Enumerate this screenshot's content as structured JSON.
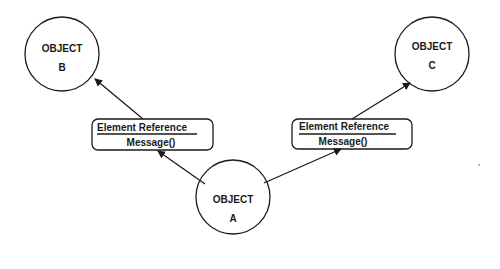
{
  "objects": {
    "a": {
      "title": "OBJECT",
      "letter": "A"
    },
    "b": {
      "title": "OBJECT",
      "letter": "B"
    },
    "c": {
      "title": "OBJECT",
      "letter": "C"
    }
  },
  "references": {
    "left": {
      "title": "Element Reference",
      "method": "Message()"
    },
    "right": {
      "title": "Element Reference",
      "method": "Message()"
    }
  }
}
